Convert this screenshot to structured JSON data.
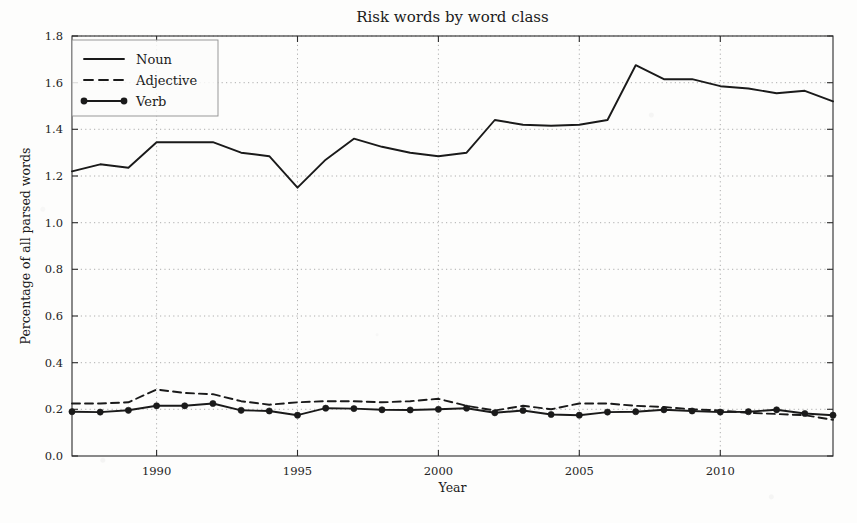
{
  "chart_data": {
    "type": "line",
    "title": "Risk words by word class",
    "xlabel": "Year",
    "ylabel": "Percentage of all parsed words",
    "xlim": [
      1987,
      2014
    ],
    "ylim": [
      0.0,
      1.8
    ],
    "grid": true,
    "legend_position": "top-left",
    "xticks": [
      "1990",
      "1995",
      "2000",
      "2005",
      "2010"
    ],
    "xtick_values": [
      1990,
      1995,
      2000,
      2005,
      2010
    ],
    "yticks": [
      "0.0",
      "0.2",
      "0.4",
      "0.6",
      "0.8",
      "1.0",
      "1.2",
      "1.4",
      "1.6",
      "1.8"
    ],
    "ytick_values": [
      0.0,
      0.2,
      0.4,
      0.6,
      0.8,
      1.0,
      1.2,
      1.4,
      1.6,
      1.8
    ],
    "x": [
      1987,
      1988,
      1989,
      1990,
      1991,
      1992,
      1993,
      1994,
      1995,
      1996,
      1997,
      1998,
      1999,
      2000,
      2001,
      2002,
      2003,
      2004,
      2005,
      2006,
      2007,
      2008,
      2009,
      2010,
      2011,
      2012,
      2013,
      2014
    ],
    "series": [
      {
        "name": "Noun",
        "style": "solid",
        "marker": "none",
        "color": "#1a1a1a",
        "values": [
          1.22,
          1.25,
          1.235,
          1.345,
          1.345,
          1.345,
          1.3,
          1.285,
          1.15,
          1.27,
          1.36,
          1.325,
          1.3,
          1.285,
          1.3,
          1.44,
          1.42,
          1.415,
          1.42,
          1.44,
          1.675,
          1.615,
          1.615,
          1.585,
          1.575,
          1.555,
          1.565,
          1.52
        ]
      },
      {
        "name": "Adjective",
        "style": "dashed",
        "marker": "none",
        "color": "#1a1a1a",
        "values": [
          0.225,
          0.225,
          0.23,
          0.285,
          0.27,
          0.265,
          0.235,
          0.22,
          0.23,
          0.235,
          0.235,
          0.23,
          0.235,
          0.245,
          0.215,
          0.195,
          0.215,
          0.2,
          0.225,
          0.225,
          0.215,
          0.21,
          0.2,
          0.195,
          0.185,
          0.18,
          0.175,
          0.155
        ]
      },
      {
        "name": "Verb",
        "style": "solid",
        "marker": "circle",
        "color": "#1a1a1a",
        "values": [
          0.19,
          0.188,
          0.196,
          0.215,
          0.215,
          0.225,
          0.196,
          0.193,
          0.175,
          0.205,
          0.203,
          0.198,
          0.197,
          0.2,
          0.205,
          0.185,
          0.195,
          0.178,
          0.175,
          0.188,
          0.19,
          0.198,
          0.193,
          0.188,
          0.19,
          0.198,
          0.182,
          0.175
        ]
      }
    ]
  },
  "legend": {
    "entries": [
      {
        "label": "Noun"
      },
      {
        "label": "Adjective"
      },
      {
        "label": "Verb"
      }
    ]
  }
}
